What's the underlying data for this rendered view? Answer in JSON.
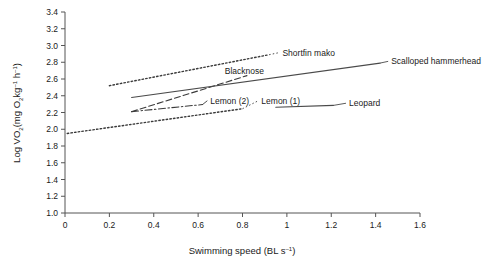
{
  "chart_data": {
    "type": "line",
    "title": "",
    "xlabel": "Swimming speed (BL s⁻¹)",
    "ylabel": "Log VO₂(mg O₂kg⁻¹ h⁻¹)",
    "xlim": [
      0,
      1.6
    ],
    "ylim": [
      1.0,
      3.4
    ],
    "grid": false,
    "legend_position": "inline-annotations",
    "xticks": [
      "0",
      "0.2",
      "0.4",
      "0.6",
      "0.8",
      "1",
      "1.2",
      "1.4",
      "1.6"
    ],
    "xtick_values": [
      0,
      0.2,
      0.4,
      0.6,
      0.8,
      1.0,
      1.2,
      1.4,
      1.6
    ],
    "yticks": [
      "1.0",
      "1.2",
      "1.4",
      "1.6",
      "1.8",
      "2.0",
      "2.2",
      "2.4",
      "2.6",
      "2.8",
      "3.0",
      "3.2",
      "3.4"
    ],
    "ytick_values": [
      1.0,
      1.2,
      1.4,
      1.6,
      1.8,
      2.0,
      2.2,
      2.4,
      2.6,
      2.8,
      3.0,
      3.2,
      3.4
    ],
    "series": [
      {
        "name": "Shortfin mako",
        "style": "dotted",
        "color": "#3a3a3a",
        "x": [
          0.2,
          0.92
        ],
        "values": [
          2.52,
          2.89
        ],
        "label_x": 0.98,
        "label_y": 2.88
      },
      {
        "name": "Blacknose",
        "style": "dashed",
        "color": "#3a3a3a",
        "x": [
          0.3,
          0.82
        ],
        "values": [
          2.21,
          2.64
        ],
        "label_x": 0.72,
        "label_y": 2.655
      },
      {
        "name": "Scalloped hammerhead",
        "style": "solid",
        "color": "#4a4a4a",
        "x": [
          0.3,
          1.42
        ],
        "values": [
          2.38,
          2.79
        ],
        "label_x": 1.47,
        "label_y": 2.775
      },
      {
        "name": "Lemon (2)",
        "style": "dashdot",
        "color": "#3a3a3a",
        "x": [
          0.3,
          0.62
        ],
        "values": [
          2.21,
          2.295
        ],
        "label_x": 0.655,
        "label_y": 2.305
      },
      {
        "name": "Lemon (1)",
        "style": "dotted",
        "color": "#3a3a3a",
        "x": [
          0.01,
          0.8
        ],
        "values": [
          1.95,
          2.245
        ],
        "label_x": 0.885,
        "label_y": 2.305
      },
      {
        "name": "Leopard",
        "style": "solid",
        "color": "#4a4a4a",
        "x": [
          0.95,
          1.21
        ],
        "values": [
          2.262,
          2.285
        ],
        "label_x": 1.28,
        "label_y": 2.275
      }
    ]
  },
  "axes": {
    "y_label_main": "Log VO",
    "y_label_sub1": "2",
    "y_label_mid": "(mg O",
    "y_label_sub2": "2",
    "y_label_kg": "kg",
    "y_label_sup1": "–1",
    "y_label_h": " h",
    "y_label_sup2": "–1",
    "y_label_close": ")",
    "x_label_main": "Swimming speed (BL s",
    "x_label_sup": "–1",
    "x_label_close": ")"
  }
}
